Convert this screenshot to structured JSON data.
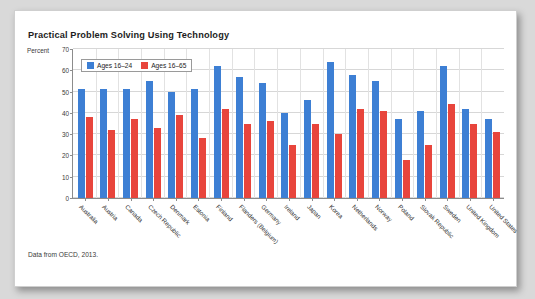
{
  "card": {
    "title": "Practical Problem Solving Using Technology",
    "source_note": "Data from OECD, 2013."
  },
  "chart_data": {
    "type": "bar",
    "title": "Practical Problem Solving Using Technology",
    "xlabel": "",
    "ylabel": "Percent",
    "ylim": [
      0,
      70
    ],
    "yticks": [
      0,
      10,
      20,
      30,
      40,
      50,
      60,
      70
    ],
    "grid": true,
    "legend_position": "top-left",
    "categories": [
      "Australia",
      "Austria",
      "Canada",
      "Czech Republic",
      "Denmark",
      "Estonia",
      "Finland",
      "Flanders (Belgium)",
      "Germany",
      "Ireland",
      "Japan",
      "Korea",
      "Netherlands",
      "Norway",
      "Poland",
      "Slovak Republic",
      "Sweden",
      "United Kingdom",
      "United States"
    ],
    "series": [
      {
        "name": "Ages 16–24",
        "color": "#3d7fd4",
        "values": [
          51,
          51,
          51,
          55,
          50,
          51,
          62,
          57,
          54,
          40,
          46,
          64,
          58,
          55,
          37,
          41,
          62,
          42,
          37
        ]
      },
      {
        "name": "Ages 16–65",
        "color": "#e8453c",
        "values": [
          38,
          32,
          37,
          33,
          39,
          28,
          42,
          35,
          36,
          25,
          35,
          30,
          42,
          41,
          18,
          25,
          44,
          35,
          31
        ]
      }
    ]
  }
}
